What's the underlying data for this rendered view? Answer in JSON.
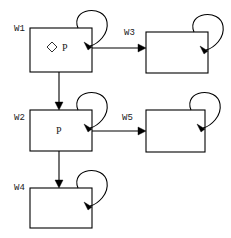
{
  "diagram": {
    "canvas": {
      "width": 231,
      "height": 238,
      "background": "#ffffff"
    },
    "stroke_color": "#000000",
    "text_color": "#1a1a1a",
    "nodes": [
      {
        "id": "W1",
        "label": "W1",
        "content": "P",
        "marker": "diamond",
        "marker_name": "diamond-glyph",
        "x": 30,
        "y": 28,
        "w": 62,
        "h": 44,
        "label_x": 14,
        "label_y": 31,
        "content_x": 64,
        "content_y": 51,
        "marker_x": 52,
        "marker_y": 47,
        "self_loop": true
      },
      {
        "id": "W3",
        "label": "W3",
        "content": "",
        "marker": "none",
        "marker_name": "",
        "x": 146,
        "y": 32,
        "w": 62,
        "h": 41,
        "label_x": 124,
        "label_y": 35,
        "content_x": 177,
        "content_y": 55,
        "marker_x": 0,
        "marker_y": 0,
        "self_loop": true
      },
      {
        "id": "W2",
        "label": "W2",
        "content": "P",
        "marker": "none",
        "marker_name": "",
        "x": 30,
        "y": 110,
        "w": 62,
        "h": 41,
        "label_x": 14,
        "label_y": 120,
        "content_x": 57,
        "content_y": 134,
        "marker_x": 0,
        "marker_y": 0,
        "self_loop": true
      },
      {
        "id": "W5",
        "label": "W5",
        "content": "",
        "marker": "none",
        "marker_name": "",
        "x": 146,
        "y": 110,
        "w": 59,
        "h": 42,
        "label_x": 122,
        "label_y": 120,
        "content_x": 175,
        "content_y": 134,
        "marker_x": 0,
        "marker_y": 0,
        "self_loop": true
      },
      {
        "id": "W4",
        "label": "W4",
        "content": "",
        "marker": "none",
        "marker_name": "",
        "x": 30,
        "y": 188,
        "w": 62,
        "h": 40,
        "label_x": 14,
        "label_y": 190,
        "content_x": 61,
        "content_y": 211,
        "marker_x": 0,
        "marker_y": 0,
        "self_loop": true
      }
    ],
    "edges": [
      {
        "from": "W1",
        "to": "W3",
        "orientation": "horizontal",
        "x1": 92,
        "y1": 48,
        "x2": 146,
        "y2": 48
      },
      {
        "from": "W1",
        "to": "W2",
        "orientation": "vertical",
        "x1": 59,
        "y1": 72,
        "x2": 59,
        "y2": 110
      },
      {
        "from": "W2",
        "to": "W5",
        "orientation": "horizontal",
        "x1": 92,
        "y1": 131,
        "x2": 146,
        "y2": 131
      },
      {
        "from": "W2",
        "to": "W4",
        "orientation": "vertical",
        "x1": 59,
        "y1": 151,
        "x2": 59,
        "y2": 188
      }
    ]
  }
}
